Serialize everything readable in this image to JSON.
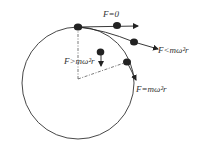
{
  "diagram": {
    "labels": {
      "f_zero": "F=0",
      "f_less": "F<mω²r",
      "f_greater": "F>mω²r",
      "f_equal": "F=mω²r"
    },
    "colors": {
      "stroke": "#333333",
      "ball": "#222222",
      "background": "#ffffff"
    }
  }
}
